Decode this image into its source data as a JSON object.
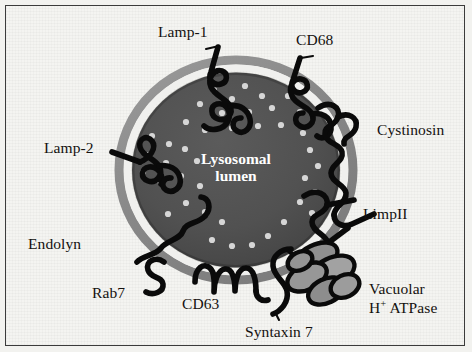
{
  "figure": {
    "background_color": "#f4f4f1",
    "frame_color": "#3b3b3b",
    "membrane_outer_color": "#8d8d8d",
    "membrane_inner_color": "#ffffff",
    "lumen_color": "#4f4f4f",
    "protein_color": "#000000",
    "glycan_dot_color": "#d8d8d8",
    "atpase_fill_color": "#9a9a9a"
  },
  "lumen": {
    "line1": "Lysosomal",
    "line2": "lumen"
  },
  "labels": {
    "lamp1": "Lamp-1",
    "cd68": "CD68",
    "cystinosin": "Cystinosin",
    "lamp2": "Lamp-2",
    "limp2": "LimpII",
    "endolyn": "Endolyn",
    "rab7": "Rab7",
    "cd63": "CD63",
    "syntaxin7": "Syntaxin 7",
    "vatpase_line1": "Vacuolar",
    "vatpase_line2_pre": "H",
    "vatpase_line2_sup": "+",
    "vatpase_line2_post": " ATPase"
  },
  "components": [
    {
      "name": "Lamp-1",
      "type": "membrane-glycoprotein"
    },
    {
      "name": "CD68",
      "type": "membrane-glycoprotein"
    },
    {
      "name": "Cystinosin",
      "type": "multipass-transporter"
    },
    {
      "name": "Lamp-2",
      "type": "membrane-glycoprotein"
    },
    {
      "name": "LimpII",
      "type": "membrane-glycoprotein"
    },
    {
      "name": "Endolyn",
      "type": "membrane-glycoprotein"
    },
    {
      "name": "Rab7",
      "type": "peripheral-gtpase"
    },
    {
      "name": "CD63",
      "type": "tetraspanin"
    },
    {
      "name": "Syntaxin 7",
      "type": "snare-protein"
    },
    {
      "name": "Vacuolar H+ ATPase",
      "type": "proton-pump"
    }
  ]
}
